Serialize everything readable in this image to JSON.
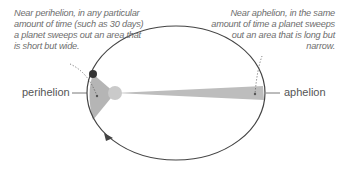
{
  "diagram": {
    "annotations": {
      "perihelion_note": "Near perihelion, in any particular amount of time (such as 30 days) a planet sweeps out an area that is short but wide.",
      "aphelion_note": "Near aphelion, in the same amount of time a planet sweeps out an area that is long but narrow."
    },
    "labels": {
      "perihelion": "perihelion",
      "aphelion": "aphelion"
    },
    "colors": {
      "orbit": "#444444",
      "swept_area": "#b8b8b8",
      "sun": "#c8c8c8",
      "planet": "#333333",
      "text": "#6d6d6d"
    }
  }
}
